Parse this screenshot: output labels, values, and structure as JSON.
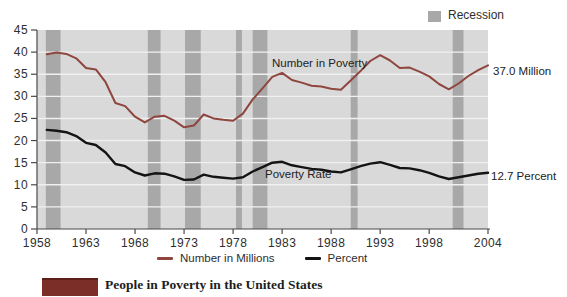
{
  "legend_top": {
    "recession_label": "Recession",
    "swatch_color": "#a8a8a8"
  },
  "annotations": {
    "number_line_label": "Number in Poverty",
    "rate_line_label": "Poverty Rate",
    "number_end_label": "37.0 Million",
    "rate_end_label": "12.7 Percent"
  },
  "legend_bottom": [
    {
      "label": "Number in Millions",
      "color": "#8e463f"
    },
    {
      "label": "Percent",
      "color": "#141414"
    }
  ],
  "caption": {
    "text": "People in Poverty in the United States"
  },
  "chart_data": {
    "type": "line",
    "title": "",
    "xlabel": "",
    "ylabel": "",
    "xlim": [
      1958,
      2004
    ],
    "ylim": [
      0,
      45
    ],
    "x_ticks": [
      1958,
      1963,
      1968,
      1973,
      1978,
      1983,
      1988,
      1993,
      1998,
      2004
    ],
    "y_ticks": [
      0,
      5,
      10,
      15,
      20,
      25,
      30,
      35,
      40,
      45
    ],
    "grid": true,
    "legend_position": "bottom",
    "plot_bg": "#d9d9d9",
    "grid_color": "#f0f0f0",
    "axis_color": "#4a4a4a",
    "recession_color": "#a8a8a8",
    "x": [
      1959,
      1960,
      1961,
      1962,
      1963,
      1964,
      1965,
      1966,
      1967,
      1968,
      1969,
      1970,
      1971,
      1972,
      1973,
      1974,
      1975,
      1976,
      1977,
      1978,
      1979,
      1980,
      1981,
      1982,
      1983,
      1984,
      1985,
      1986,
      1987,
      1988,
      1989,
      1990,
      1991,
      1992,
      1993,
      1994,
      1995,
      1996,
      1997,
      1998,
      1999,
      2000,
      2001,
      2002,
      2003,
      2004
    ],
    "series": [
      {
        "name": "Number in Millions",
        "color": "#8e463f",
        "end_label": "37.0 Million",
        "values": [
          39.5,
          39.9,
          39.6,
          38.6,
          36.4,
          36.1,
          33.2,
          28.5,
          27.8,
          25.4,
          24.1,
          25.4,
          25.6,
          24.5,
          23.0,
          23.4,
          25.9,
          25.0,
          24.7,
          24.5,
          26.1,
          29.3,
          31.8,
          34.4,
          35.3,
          33.7,
          33.1,
          32.4,
          32.2,
          31.7,
          31.5,
          33.6,
          35.7,
          38.0,
          39.3,
          38.1,
          36.4,
          36.5,
          35.6,
          34.5,
          32.8,
          31.6,
          32.9,
          34.6,
          35.9,
          37.0
        ]
      },
      {
        "name": "Percent",
        "color": "#141414",
        "end_label": "12.7 Percent",
        "values": [
          22.4,
          22.2,
          21.9,
          21.0,
          19.5,
          19.0,
          17.3,
          14.7,
          14.2,
          12.8,
          12.1,
          12.6,
          12.5,
          11.9,
          11.1,
          11.2,
          12.3,
          11.8,
          11.6,
          11.4,
          11.7,
          13.0,
          14.0,
          15.0,
          15.2,
          14.4,
          14.0,
          13.6,
          13.4,
          13.0,
          12.8,
          13.5,
          14.2,
          14.8,
          15.1,
          14.5,
          13.8,
          13.7,
          13.3,
          12.7,
          11.9,
          11.3,
          11.7,
          12.1,
          12.5,
          12.7
        ]
      }
    ],
    "recessions": [
      [
        1958.9,
        1960.4
      ],
      [
        1969.3,
        1970.6
      ],
      [
        1973.1,
        1974.7
      ],
      [
        1978.3,
        1978.9
      ],
      [
        1980.0,
        1981.5
      ],
      [
        1990.0,
        1990.7
      ],
      [
        2000.4,
        2001.5
      ]
    ]
  }
}
